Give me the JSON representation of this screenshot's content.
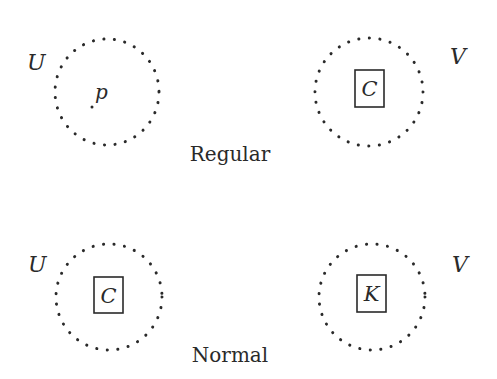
{
  "diagram": {
    "panels": [
      {
        "title": "Regular",
        "left": {
          "set_label": "U",
          "content_type": "point",
          "content_label": "p"
        },
        "right": {
          "set_label": "V",
          "content_type": "boxed-set",
          "content_label": "C"
        }
      },
      {
        "title": "Normal",
        "left": {
          "set_label": "U",
          "content_type": "boxed-set",
          "content_label": "C"
        },
        "right": {
          "set_label": "V",
          "content_type": "boxed-set",
          "content_label": "K"
        }
      }
    ],
    "style": {
      "ink_color": "#2a2a2a",
      "background": "#ffffff",
      "neighborhood_outline": "dotted"
    }
  }
}
